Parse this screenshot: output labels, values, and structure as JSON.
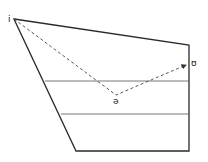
{
  "diagram": {
    "type": "vowel-trapezoid",
    "colors": {
      "line": "#2a2a2a",
      "path": "#444444",
      "background": "#ffffff"
    },
    "outline": {
      "top_left": [
        14,
        19
      ],
      "top_right": [
        189,
        45
      ],
      "bottom_right": [
        189,
        151
      ],
      "bottom_left": [
        76,
        151
      ]
    },
    "horizontal_lines": [
      {
        "y": 81,
        "x1": 45,
        "x2": 189
      },
      {
        "y": 114,
        "x1": 61,
        "x2": 189
      }
    ],
    "glide_path": {
      "style": "dashed",
      "points": [
        [
          14,
          19
        ],
        [
          116,
          95
        ],
        [
          186,
          65
        ]
      ],
      "arrow_end": true
    },
    "labels": [
      {
        "id": "start",
        "text": "i",
        "x": 8,
        "y": 22
      },
      {
        "id": "mid",
        "text": "ə",
        "x": 113,
        "y": 104
      },
      {
        "id": "end",
        "text": "ʊ",
        "x": 191,
        "y": 66
      }
    ]
  }
}
